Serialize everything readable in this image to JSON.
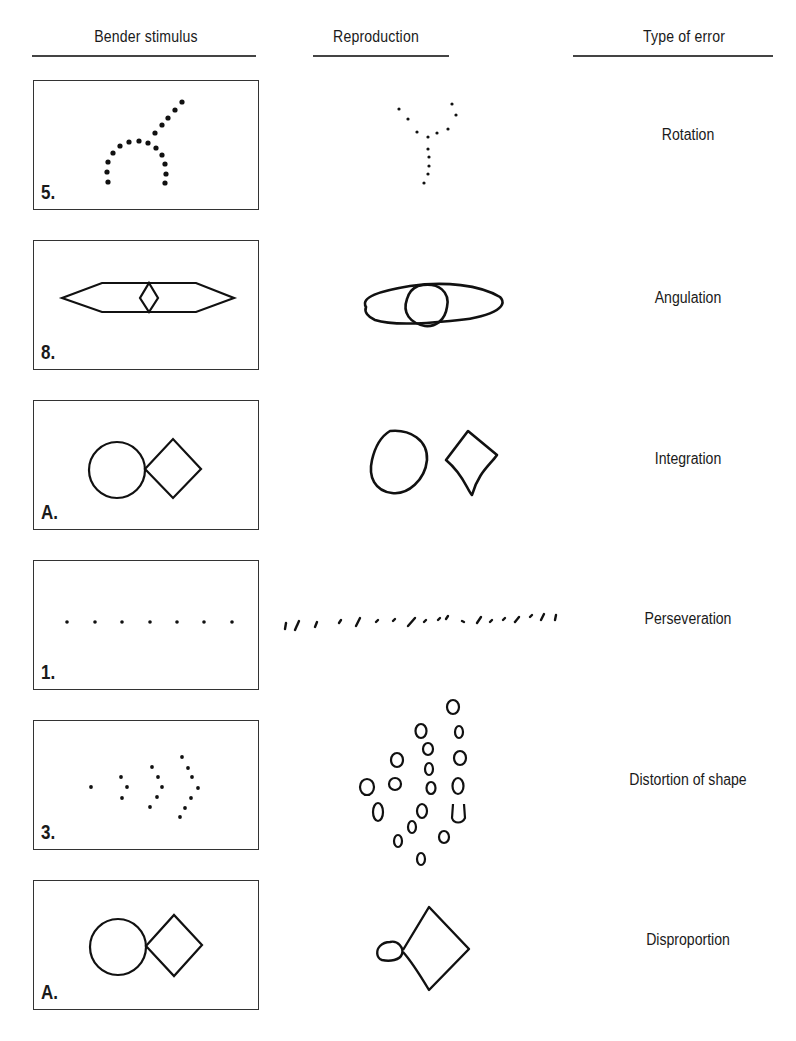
{
  "headers": {
    "stimulus": "Bender stimulus",
    "reproduction": "Reproduction",
    "error_type": "Type of error"
  },
  "rows": [
    {
      "figure_number": "5.",
      "stimulus_shape": "dotted arc with diagonal dotted line",
      "reproduction_shape": "rotated dotted Y shape",
      "error": "Rotation"
    },
    {
      "figure_number": "8.",
      "stimulus_shape": "elongated hexagon with small central diamond",
      "reproduction_shape": "ellipse with circle",
      "error": "Angulation"
    },
    {
      "figure_number": "A.",
      "stimulus_shape": "circle touching diamond",
      "reproduction_shape": "separated oval and distorted diamond",
      "error": "Integration"
    },
    {
      "figure_number": "1.",
      "stimulus_shape": "row of 7 dots",
      "reproduction_shape": "long row of dashes extending past box",
      "error": "Perseveration"
    },
    {
      "figure_number": "3.",
      "stimulus_shape": "arrow of dots in arcs",
      "reproduction_shape": "scattered small loops",
      "error": "Distortion of shape"
    },
    {
      "figure_number": "A.",
      "stimulus_shape": "circle touching diamond",
      "reproduction_shape": "tiny oval touching large diamond",
      "error": "Disproportion"
    }
  ],
  "colors": {
    "ink": "#1a1a1a",
    "rule": "#444444",
    "background": "#ffffff"
  }
}
